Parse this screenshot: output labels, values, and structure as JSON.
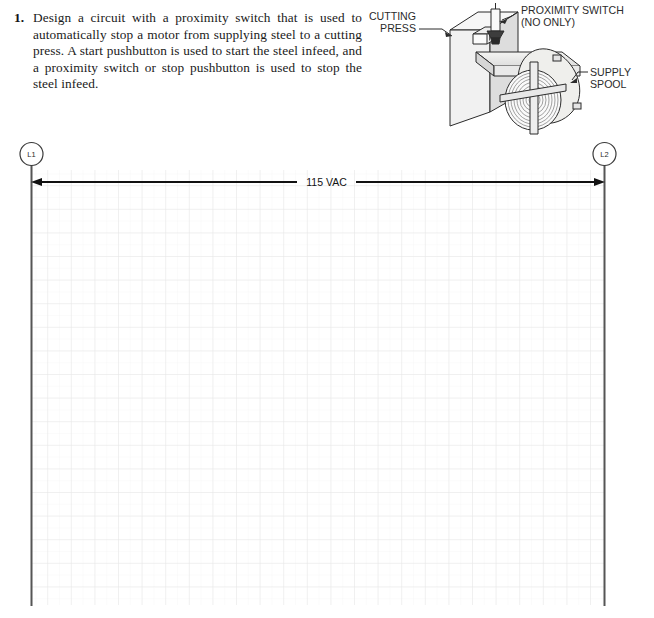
{
  "problem": {
    "number": "1.",
    "text": "Design a circuit with a proximity switch that is used to automatically stop a motor from supplying steel to a cutting press. A start pushbutton is used to start the steel infeed, and a proximity switch or stop pushbutton is used to stop the steel infeed."
  },
  "illustration": {
    "name": "cutting-press-with-supply-spool",
    "callouts": [
      {
        "id": "cutting-press",
        "line1": "CUTTING",
        "line2": "PRESS"
      },
      {
        "id": "proximity-switch",
        "line1": "PROXIMITY SWITCH",
        "line2": "(NO ONLY)"
      },
      {
        "id": "supply-spool",
        "line1": "SUPPLY",
        "line2": "SPOOL"
      }
    ]
  },
  "ladder": {
    "left_rail_label": "L1",
    "right_rail_label": "L2",
    "supply_label": "115 VAC",
    "grid": {
      "cell_size": 23.6,
      "cols": 25,
      "rows": 19,
      "line_color": "#e3e3e3",
      "sub_line_color": "#f0f0f0"
    },
    "rail_color": "#4a4a4a",
    "wire_color": "#111111"
  },
  "colors": {
    "text": "#1a1a1a",
    "line": "#2b2b2b",
    "press_face": "#f2f2f2",
    "press_shade": "#d8d8d8",
    "strip": "#e7e7e4",
    "spool": "#efefec"
  }
}
